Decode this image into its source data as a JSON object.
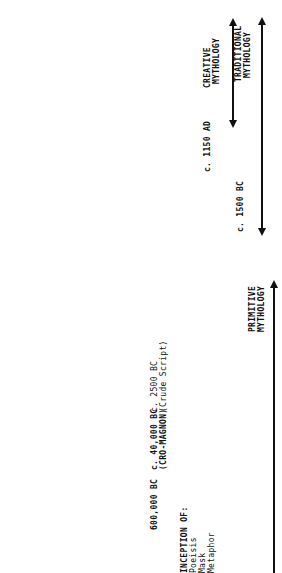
{
  "periods": {
    "creative": {
      "date": "c. 1150 AD",
      "label1": "CREATIVE",
      "label2": "MYTHOLOGY"
    },
    "traditional": {
      "date": "c. 1500 BC",
      "label1": "TRADITIONAL",
      "label2": "MYTHOLOGY"
    },
    "primitive": {
      "label1": "PRIMITIVE",
      "label2": "MYTHOLOGY"
    }
  },
  "milestones": {
    "m1": {
      "date": "600,000 BC"
    },
    "m2": {
      "date": "c. 40,000 BC",
      "note": "(CRO-MAGNON)"
    },
    "m3": {
      "date": "c. 2500 BC",
      "note": "(Crude Script)"
    }
  },
  "inception": {
    "title": "INCEPTION OF:",
    "items": [
      "Poeisis",
      "Mask",
      "Metaphor"
    ]
  }
}
